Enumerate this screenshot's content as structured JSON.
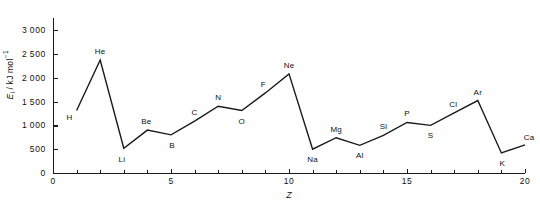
{
  "chart_data": {
    "type": "line",
    "title": "",
    "xlabel": "Z",
    "ylabel": "E_i / kJ mol^-1",
    "ylabel_parts": {
      "symbol": "E",
      "subscript": "i",
      "separator": " / kJ mol",
      "superscript": "-1"
    },
    "xlim": [
      0,
      20
    ],
    "ylim": [
      0,
      3000
    ],
    "grid": false,
    "legend": null,
    "x_ticks": [
      0,
      5,
      10,
      15,
      20
    ],
    "x_tick_labels": [
      "0",
      "5",
      "10",
      "15",
      "20"
    ],
    "x_minor_ticks": [
      1,
      2,
      3,
      4,
      6,
      7,
      8,
      9,
      11,
      12,
      13,
      14,
      16,
      17,
      18,
      19
    ],
    "y_ticks": [
      0,
      500,
      1000,
      1500,
      2000,
      2500,
      3000
    ],
    "y_tick_labels": [
      "0",
      "500",
      "1000",
      "1500",
      "2000",
      "2500",
      "3000"
    ],
    "point_labels": [
      "H",
      "He",
      "Li",
      "Be",
      "B",
      "C",
      "N",
      "O",
      "F",
      "Ne",
      "Na",
      "Mg",
      "Al",
      "Si",
      "P",
      "S",
      "Cl",
      "Ar",
      "K",
      "Ca"
    ],
    "x": [
      1,
      2,
      3,
      4,
      5,
      6,
      7,
      8,
      9,
      10,
      11,
      12,
      13,
      14,
      15,
      16,
      17,
      18,
      19,
      20
    ],
    "values": [
      1310,
      2370,
      520,
      900,
      800,
      1090,
      1400,
      1310,
      1680,
      2080,
      500,
      740,
      580,
      790,
      1060,
      1000,
      1260,
      1520,
      420,
      590
    ],
    "label_offsets": [
      {
        "dx": -7,
        "dy": 6
      },
      {
        "dx": 0,
        "dy": -9
      },
      {
        "dx": -2,
        "dy": 11
      },
      {
        "dx": -1,
        "dy": -9
      },
      {
        "dx": 1,
        "dy": 10
      },
      {
        "dx": 0,
        "dy": -9
      },
      {
        "dx": 0,
        "dy": -9
      },
      {
        "dx": 0,
        "dy": 10
      },
      {
        "dx": -2,
        "dy": -9
      },
      {
        "dx": 0,
        "dy": -9
      },
      {
        "dx": 0,
        "dy": 10
      },
      {
        "dx": 0,
        "dy": -9
      },
      {
        "dx": 0,
        "dy": 10
      },
      {
        "dx": 0,
        "dy": -9
      },
      {
        "dx": 0,
        "dy": -9
      },
      {
        "dx": 0,
        "dy": 10
      },
      {
        "dx": -1,
        "dy": -9
      },
      {
        "dx": 0,
        "dy": -9
      },
      {
        "dx": 1,
        "dy": 10
      },
      {
        "dx": 4,
        "dy": -8
      }
    ],
    "line_color": "#1a1a1a",
    "line_width": 1.4,
    "axis_color": "#1a1a1a",
    "background": "#ffffff"
  }
}
